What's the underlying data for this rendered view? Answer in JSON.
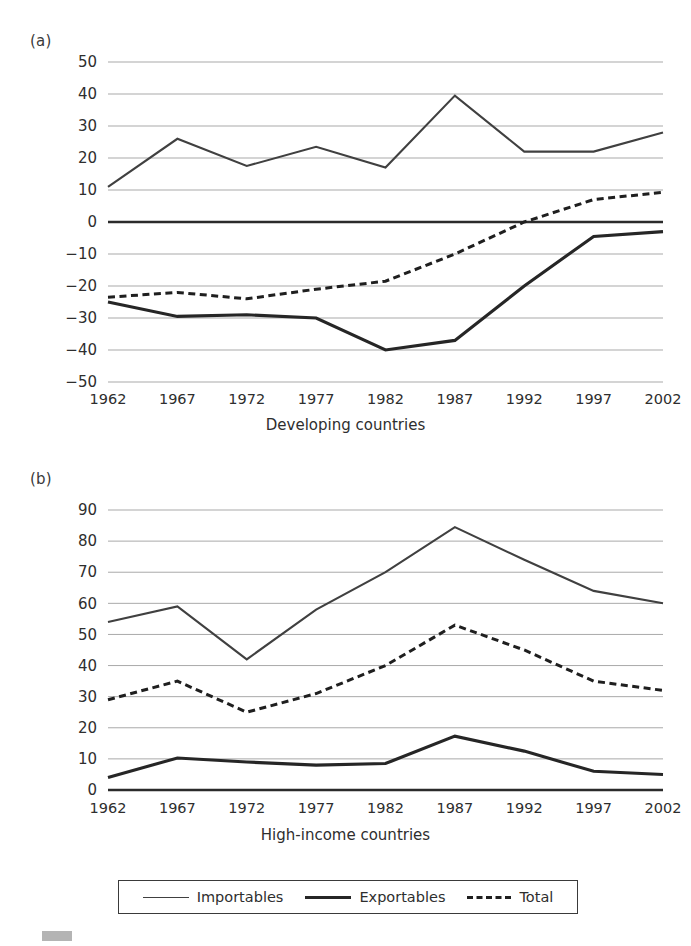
{
  "figure": {
    "panel_a_letter": "(a)",
    "panel_b_letter": "(b)",
    "caption_a": "Developing countries",
    "caption_b": "High-income countries"
  },
  "legend": {
    "position": "bottom-center",
    "entries": [
      {
        "label": "Importables",
        "style": "thin-solid"
      },
      {
        "label": "Exportables",
        "style": "thick-solid"
      },
      {
        "label": "Total",
        "style": "dashed"
      }
    ]
  },
  "chart_data": [
    {
      "type": "line",
      "panel": "(a)",
      "title": "Developing countries",
      "xlabel": "",
      "ylabel": "",
      "categories": [
        "1962",
        "1967",
        "1972",
        "1977",
        "1982",
        "1987",
        "1992",
        "1997",
        "2002"
      ],
      "x": [
        1962,
        1967,
        1972,
        1977,
        1982,
        1987,
        1992,
        1997,
        2002
      ],
      "ylim": [
        -50,
        50
      ],
      "yticks": [
        50,
        40,
        30,
        20,
        10,
        0,
        -10,
        -20,
        -30,
        -40,
        -50
      ],
      "ytick_labels": [
        "50",
        "40",
        "30",
        "20",
        "10",
        "0",
        "−10",
        "−20",
        "−30",
        "−40",
        "−50"
      ],
      "grid": true,
      "zero_line": true,
      "series": [
        {
          "name": "Importables",
          "style": "thin-solid",
          "values": [
            11,
            26,
            17.5,
            23.5,
            17,
            39.5,
            22,
            22,
            28
          ]
        },
        {
          "name": "Exportables",
          "style": "thick-solid",
          "values": [
            -25,
            -29.5,
            -29,
            -30,
            -40,
            -37,
            -20,
            -4.5,
            -3
          ]
        },
        {
          "name": "Total",
          "style": "dashed",
          "values": [
            -23.5,
            -22,
            -24,
            -21,
            -18.5,
            -10,
            0,
            7,
            9.3
          ]
        }
      ]
    },
    {
      "type": "line",
      "panel": "(b)",
      "title": "High-income countries",
      "xlabel": "",
      "ylabel": "",
      "categories": [
        "1962",
        "1967",
        "1972",
        "1977",
        "1982",
        "1987",
        "1992",
        "1997",
        "2002"
      ],
      "x": [
        1962,
        1967,
        1972,
        1977,
        1982,
        1987,
        1992,
        1997,
        2002
      ],
      "ylim": [
        0,
        90
      ],
      "yticks": [
        90,
        80,
        70,
        60,
        50,
        40,
        30,
        20,
        10,
        0
      ],
      "ytick_labels": [
        "90",
        "80",
        "70",
        "60",
        "50",
        "40",
        "30",
        "20",
        "10",
        "0"
      ],
      "grid": true,
      "zero_line": true,
      "series": [
        {
          "name": "Importables",
          "style": "thin-solid",
          "values": [
            54,
            59,
            42,
            58,
            70,
            84.5,
            74,
            64,
            60
          ]
        },
        {
          "name": "Exportables",
          "style": "thick-solid",
          "values": [
            4,
            10.3,
            9,
            8,
            8.5,
            17.3,
            12.5,
            6,
            5
          ]
        },
        {
          "name": "Total",
          "style": "dashed",
          "values": [
            29,
            35,
            25,
            31,
            40,
            53,
            45,
            35,
            32
          ]
        }
      ]
    }
  ],
  "colors": {
    "importables": "#404040",
    "exportables": "#262626",
    "total": "#1f1f1f",
    "grid": "#a9a9a9",
    "zero": "#2b2b2b",
    "text": "#2e2e2e"
  }
}
